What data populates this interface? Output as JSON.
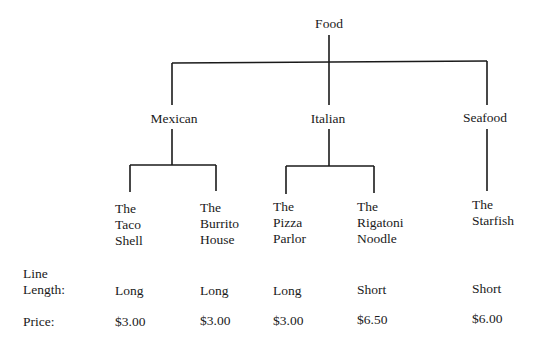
{
  "tree": {
    "root": "Food",
    "categories": [
      {
        "label": "Mexican",
        "restaurants": [
          {
            "lines": [
              "The",
              "Taco",
              "Shell"
            ]
          },
          {
            "lines": [
              "The",
              "Burrito",
              "House"
            ]
          }
        ]
      },
      {
        "label": "Italian",
        "restaurants": [
          {
            "lines": [
              "The",
              "Pizza",
              "Parlor"
            ]
          },
          {
            "lines": [
              "The",
              "Rigatoni",
              "Noodle"
            ]
          }
        ]
      },
      {
        "label": "Seafood",
        "restaurants": [
          {
            "lines": [
              "The",
              "Starfish"
            ]
          }
        ]
      }
    ]
  },
  "table": {
    "line_length_label": [
      "Line",
      "Length:"
    ],
    "price_label": "Price:",
    "line_length": [
      "Long",
      "Long",
      "Long",
      "Short",
      "Short"
    ],
    "price": [
      "$3.00",
      "$3.00",
      "$3.00",
      "$6.50",
      "$6.00"
    ]
  }
}
